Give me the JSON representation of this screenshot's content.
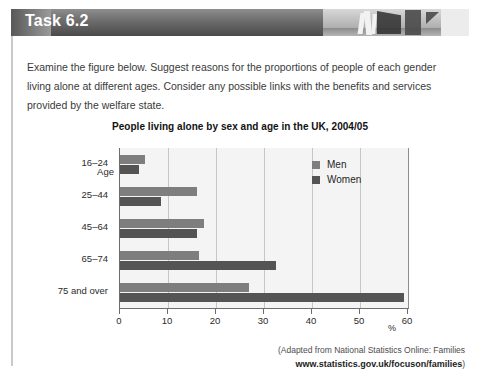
{
  "header": {
    "task_title": "Task 6.2",
    "photo_alt": "gallery-photo-strip"
  },
  "prompt": {
    "text": "Examine the figure below. Suggest reasons for the proportions of people of each gender living alone at different ages. Consider any possible links with the benefits and services provided by the welfare state."
  },
  "chart_data": {
    "type": "bar",
    "orientation": "horizontal",
    "title": "People living alone by sex and age in the UK, 2004/05",
    "xlabel": "%",
    "ylabel": "Age",
    "categories": [
      "16–24",
      "25–44",
      "45–64",
      "65–74",
      "75 and over"
    ],
    "series": [
      {
        "name": "Men",
        "color": "#7e7e7e",
        "values": [
          5.2,
          16.0,
          17.4,
          16.4,
          26.9
        ]
      },
      {
        "name": "Women",
        "color": "#545454",
        "values": [
          4.0,
          8.5,
          16.1,
          32.4,
          59.1
        ]
      }
    ],
    "xlim": [
      0,
      60
    ],
    "xticks": [
      0,
      10,
      20,
      30,
      40,
      50,
      60
    ],
    "xtick_labels": [
      "0",
      "10",
      "20",
      "30",
      "40",
      "50",
      "60"
    ],
    "grid": true,
    "legend_position": "top-right"
  },
  "source": {
    "line1": "(Adapted from National Statistics Online: Families",
    "line2": "www.statistics.gov.uk/focuson/families",
    "line2_suffix": ")"
  }
}
